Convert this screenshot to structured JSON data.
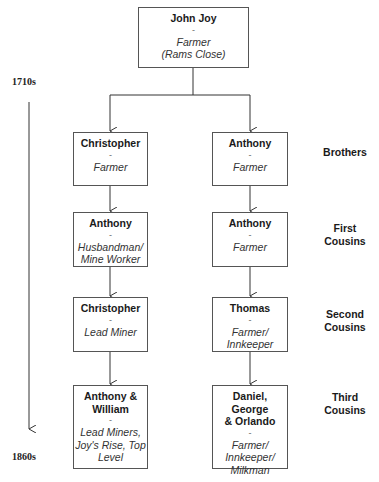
{
  "timeline": {
    "start_label": "1710s",
    "end_label": "1860s"
  },
  "root": {
    "name": "John Joy",
    "separator": "-",
    "occupation": "Farmer\n(Rams Close)"
  },
  "generations": [
    {
      "relation": "Brothers",
      "left": {
        "name": "Christopher",
        "separator": "-",
        "occupation": "Farmer"
      },
      "right": {
        "name": "Anthony",
        "separator": "-",
        "occupation": "Farmer"
      }
    },
    {
      "relation": "First\nCousins",
      "left": {
        "name": "Anthony",
        "separator": "-",
        "occupation": "Husbandman/\nMine Worker"
      },
      "right": {
        "name": "Anthony",
        "separator": "-",
        "occupation": "Farmer"
      }
    },
    {
      "relation": "Second\nCousins",
      "left": {
        "name": "Christopher",
        "separator": "-",
        "occupation": "Lead Miner"
      },
      "right": {
        "name": "Thomas",
        "separator": "-",
        "occupation": "Farmer/\nInnkeeper"
      }
    },
    {
      "relation": "Third\nCousins",
      "left": {
        "name": "Anthony &\nWilliam",
        "separator": "-",
        "occupation": "Lead Miners,\nJoy's Rise, Top\nLevel"
      },
      "right": {
        "name": "Daniel, George\n& Orlando",
        "separator": "-",
        "occupation": "Farmer/\nInnkeeper/\nMilkman"
      }
    }
  ]
}
